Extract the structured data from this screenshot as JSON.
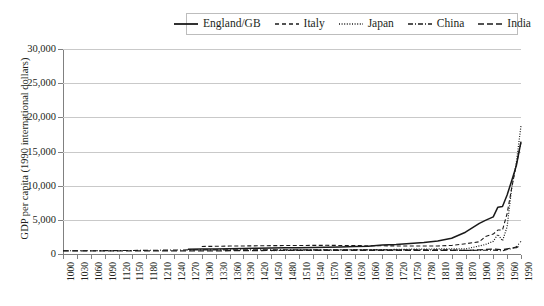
{
  "chart_data": {
    "type": "line",
    "title": "",
    "xlabel": "",
    "ylabel": "GDP per capita (1990 international dollars)",
    "xlim": [
      1000,
      1990
    ],
    "ylim": [
      0,
      30000
    ],
    "grid": true,
    "legend_position": "top",
    "y_ticks": [
      "0",
      "5,000",
      "10,000",
      "15,000",
      "20,000",
      "25,000",
      "30,000"
    ],
    "y_tick_values": [
      0,
      5000,
      10000,
      15000,
      20000,
      25000,
      30000
    ],
    "x_ticks": [
      "1000",
      "1030",
      "1060",
      "1090",
      "1120",
      "1150",
      "1180",
      "1210",
      "1240",
      "1270",
      "1300",
      "1330",
      "1360",
      "1390",
      "1420",
      "1450",
      "1480",
      "1510",
      "1540",
      "1570",
      "1600",
      "1630",
      "1660",
      "1690",
      "1720",
      "1750",
      "1780",
      "1810",
      "1840",
      "1870",
      "1900",
      "1930",
      "1960",
      "1990"
    ],
    "series": [
      {
        "name": "England/GB",
        "style": "solid",
        "x": [
          1270,
          1300,
          1330,
          1360,
          1390,
          1420,
          1450,
          1480,
          1510,
          1540,
          1570,
          1600,
          1630,
          1660,
          1690,
          1720,
          1750,
          1780,
          1810,
          1840,
          1870,
          1900,
          1913,
          1930,
          1940,
          1950,
          1960,
          1970,
          1980,
          1990
        ],
        "values": [
          700,
          720,
          750,
          780,
          820,
          850,
          880,
          900,
          930,
          960,
          1000,
          1040,
          1080,
          1150,
          1300,
          1400,
          1550,
          1700,
          1900,
          2300,
          3190,
          4490,
          4920,
          5440,
          6856,
          6939,
          8645,
          10767,
          12931,
          16430
        ]
      },
      {
        "name": "Italy",
        "style": "dashed",
        "x": [
          1300,
          1330,
          1360,
          1390,
          1420,
          1450,
          1480,
          1510,
          1540,
          1570,
          1600,
          1630,
          1660,
          1690,
          1720,
          1750,
          1780,
          1810,
          1840,
          1870,
          1900,
          1913,
          1930,
          1940,
          1950,
          1960,
          1970,
          1980,
          1990
        ],
        "values": [
          1100,
          1130,
          1160,
          1180,
          1200,
          1220,
          1240,
          1250,
          1260,
          1270,
          1250,
          1230,
          1210,
          1200,
          1180,
          1170,
          1160,
          1180,
          1250,
          1499,
          1785,
          2564,
          2913,
          3505,
          3502,
          5916,
          9719,
          13149,
          16320
        ]
      },
      {
        "name": "Japan",
        "style": "dotted",
        "x": [
          1450,
          1480,
          1510,
          1540,
          1570,
          1600,
          1630,
          1660,
          1690,
          1720,
          1750,
          1780,
          1810,
          1840,
          1870,
          1900,
          1913,
          1930,
          1940,
          1950,
          1960,
          1970,
          1980,
          1990
        ],
        "values": [
          500,
          520,
          540,
          560,
          570,
          590,
          600,
          620,
          640,
          670,
          700,
          720,
          740,
          760,
          737,
          1180,
          1387,
          1850,
          2874,
          1921,
          3986,
          9714,
          13428,
          18789
        ]
      },
      {
        "name": "China",
        "style": "dash-dot",
        "x": [
          1000,
          1030,
          1060,
          1090,
          1120,
          1140,
          1270,
          1300,
          1330,
          1360,
          1390,
          1420,
          1450,
          1480,
          1510,
          1540,
          1570,
          1600,
          1630,
          1660,
          1690,
          1720,
          1750,
          1780,
          1810,
          1840,
          1870,
          1900,
          1913,
          1930,
          1950,
          1960,
          1970,
          1980,
          1990
        ],
        "values": [
          466,
          470,
          480,
          490,
          500,
          510,
          600,
          600,
          600,
          600,
          600,
          600,
          600,
          600,
          600,
          600,
          600,
          600,
          600,
          600,
          600,
          600,
          600,
          600,
          600,
          600,
          530,
          545,
          552,
          568,
          448,
          662,
          778,
          1067,
          1858
        ]
      },
      {
        "name": "India",
        "style": "dashed-long",
        "x": [
          1000,
          1300,
          1500,
          1600,
          1700,
          1750,
          1800,
          1850,
          1870,
          1900,
          1913,
          1930,
          1950,
          1960,
          1970,
          1980,
          1990
        ],
        "values": [
          450,
          450,
          550,
          550,
          550,
          550,
          533,
          533,
          533,
          599,
          673,
          726,
          619,
          753,
          868,
          938,
          1309
        ]
      }
    ]
  },
  "legend": {
    "items": [
      {
        "label": "England/GB",
        "style": "solid"
      },
      {
        "label": "Italy",
        "style": "dashed"
      },
      {
        "label": "Japan",
        "style": "dotted"
      },
      {
        "label": "China",
        "style": "dash-dot"
      },
      {
        "label": "India",
        "style": "dashed-long"
      }
    ]
  },
  "axis": {
    "y_title": "GDP per capita (1990 international dollars)"
  }
}
